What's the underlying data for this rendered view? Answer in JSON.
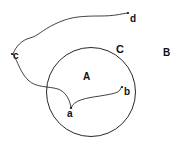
{
  "diagram": {
    "regions": {
      "inside_circle": "A",
      "outside_circle": "B",
      "boundary": "C"
    },
    "points": {
      "a": "a",
      "b": "b",
      "c": "c",
      "d": "d"
    },
    "curves": [
      {
        "from": "a",
        "to": "b"
      },
      {
        "from": "a",
        "to": "c"
      },
      {
        "from": "c",
        "to": "d"
      }
    ],
    "colors": {
      "stroke": "#111111",
      "background": "#ffffff"
    }
  }
}
